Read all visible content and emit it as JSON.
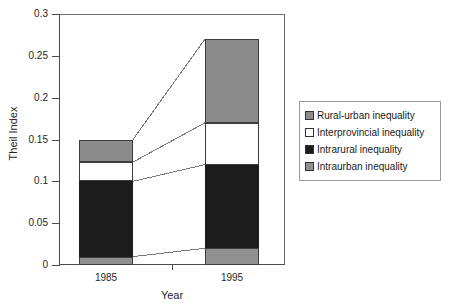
{
  "chart_data": {
    "type": "bar",
    "subtype": "stacked",
    "title": "",
    "xlabel": "Year",
    "ylabel": "Theil Index",
    "categories": [
      "1985",
      "1995"
    ],
    "ylim": [
      0,
      0.3
    ],
    "yticks": [
      0,
      0.05,
      0.1,
      0.15,
      0.2,
      0.25,
      0.3
    ],
    "ytick_labels": [
      "0",
      "0.05",
      "0.1",
      "0.15",
      "0.2",
      "0.25",
      "0.3"
    ],
    "grid": false,
    "legend_position": "right",
    "stack_order_bottom_to_top": [
      "Intraurban inequality",
      "Intrarural inequality",
      "Interprovincial inequality",
      "Rural-urban inequality"
    ],
    "series": [
      {
        "name": "Intraurban inequality",
        "color": "#909090",
        "values": [
          0.01,
          0.02
        ]
      },
      {
        "name": "Intrarural inequality",
        "color": "#1c1c1c",
        "values": [
          0.09,
          0.1
        ]
      },
      {
        "name": "Interprovincial inequality",
        "color": "#ffffff",
        "values": [
          0.023,
          0.05
        ]
      },
      {
        "name": "Rural-urban inequality",
        "color": "#8c8c8c",
        "values": [
          0.027,
          0.1
        ]
      }
    ],
    "totals": [
      0.15,
      0.27
    ],
    "cumulative_boundaries": {
      "1985": [
        0.01,
        0.1,
        0.123,
        0.15
      ],
      "1995": [
        0.02,
        0.12,
        0.17,
        0.27
      ]
    }
  },
  "legend": {
    "items": [
      {
        "label": "Rural-urban inequality",
        "swatch": "#8c8c8c",
        "name": "legend-swatch-rural-urban"
      },
      {
        "label": "Interprovincial inequality",
        "swatch": "#ffffff",
        "name": "legend-swatch-interprovincial"
      },
      {
        "label": "Intrarural inequality",
        "swatch": "#1c1c1c",
        "name": "legend-swatch-intrarural"
      },
      {
        "label": "Intraurban inequality",
        "swatch": "#909090",
        "name": "legend-swatch-intraurban"
      }
    ]
  },
  "axes": {
    "y_title": "Theil Index",
    "x_title": "Year",
    "y_labels": [
      "0.3",
      "0.25",
      "0.2",
      "0.15",
      "0.1",
      "0.05",
      "0"
    ],
    "x_labels": [
      "1985",
      "1995"
    ]
  },
  "colors": {
    "axis": "#4d4d4d",
    "frame": "#6e6e6e",
    "leader_line": "#7a7a7a",
    "text": "#262626",
    "background": "#ffffff"
  }
}
